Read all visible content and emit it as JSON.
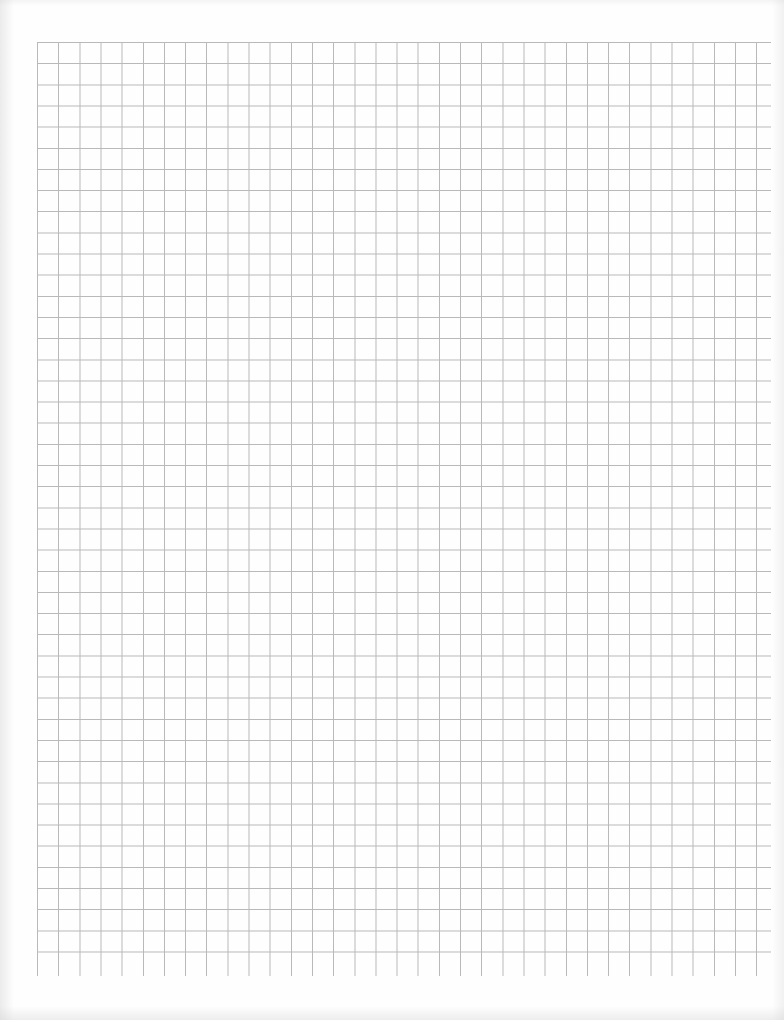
{
  "document": {
    "type": "graph-paper",
    "content_text": ""
  },
  "grid": {
    "left": 37,
    "top": 42,
    "cell_size": 21.15,
    "columns": 34,
    "rows": 44,
    "horizontal_line_right_extent": 771,
    "vertical_line_bottom_extent": 976,
    "line_color": "#b9b9b9",
    "paper_color": "#fefefe"
  }
}
